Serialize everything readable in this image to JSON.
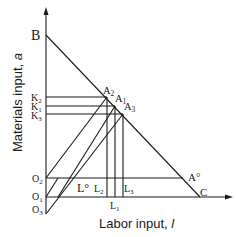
{
  "figure": {
    "type": "economics-diagram",
    "x_axis_label": "Labor input, ",
    "x_axis_var": "l",
    "y_axis_label": "Materials input, ",
    "y_axis_var": "a",
    "points": {
      "B": "B",
      "C": "C",
      "A_star": "A°",
      "A1": "A",
      "A1_sub": "1",
      "A2": "A",
      "A2_sub": "2",
      "A3": "A",
      "A3_sub": "3"
    },
    "y_labels": {
      "K2": "K",
      "K2_sub": "2",
      "K1": "K",
      "K1_sub": "1",
      "K3": "K",
      "K3_sub": "3",
      "O2": "O",
      "O2_sub": "2",
      "O1": "O",
      "O1_sub": "1",
      "O3": "O",
      "O3_sub": "3"
    },
    "x_labels": {
      "L_star": "L°",
      "L2": "L",
      "L2_sub": "2",
      "L1": "L",
      "L1_sub": "1",
      "L3": "L",
      "L3_sub": "3"
    },
    "colors": {
      "line": "#1a1a1a",
      "background": "#ffffff"
    }
  }
}
